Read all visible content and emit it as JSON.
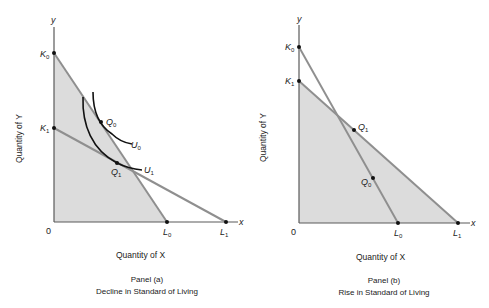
{
  "panel_a": {
    "title": "Panel (a)",
    "subtitle": "Decline in Standard of Living",
    "x_axis_title": "Quantity of X",
    "y_axis_title": "Quantity of Y",
    "axis_x_label": "x",
    "axis_y_label": "y",
    "origin_label": "0",
    "points": {
      "K0": "K",
      "K0_sub": "0",
      "K1": "K",
      "K1_sub": "1",
      "L0": "L",
      "L0_sub": "0",
      "L1": "L",
      "L1_sub": "1",
      "Q0": "Q",
      "Q0_sub": "0",
      "Q1": "Q",
      "Q1_sub": "1"
    },
    "curves": {
      "U0": "U",
      "U0_sub": "0",
      "U1": "U",
      "U1_sub": "1"
    }
  },
  "panel_b": {
    "title": "Panel (b)",
    "subtitle": "Rise in Standard of Living",
    "x_axis_title": "Quantity of X",
    "y_axis_title": "Quantity of Y",
    "axis_x_label": "x",
    "axis_y_label": "y",
    "origin_label": "0",
    "points": {
      "K0": "K",
      "K0_sub": "0",
      "K1": "K",
      "K1_sub": "1",
      "L0": "L",
      "L0_sub": "0",
      "L1": "L",
      "L1_sub": "1",
      "Q0": "Q",
      "Q0_sub": "0",
      "Q1": "Q",
      "Q1_sub": "1"
    }
  },
  "colors": {
    "shade": "#dcdcdc",
    "budget_line": "#8f8f8f",
    "curve": "#111111",
    "axis": "#5a5a5a"
  }
}
